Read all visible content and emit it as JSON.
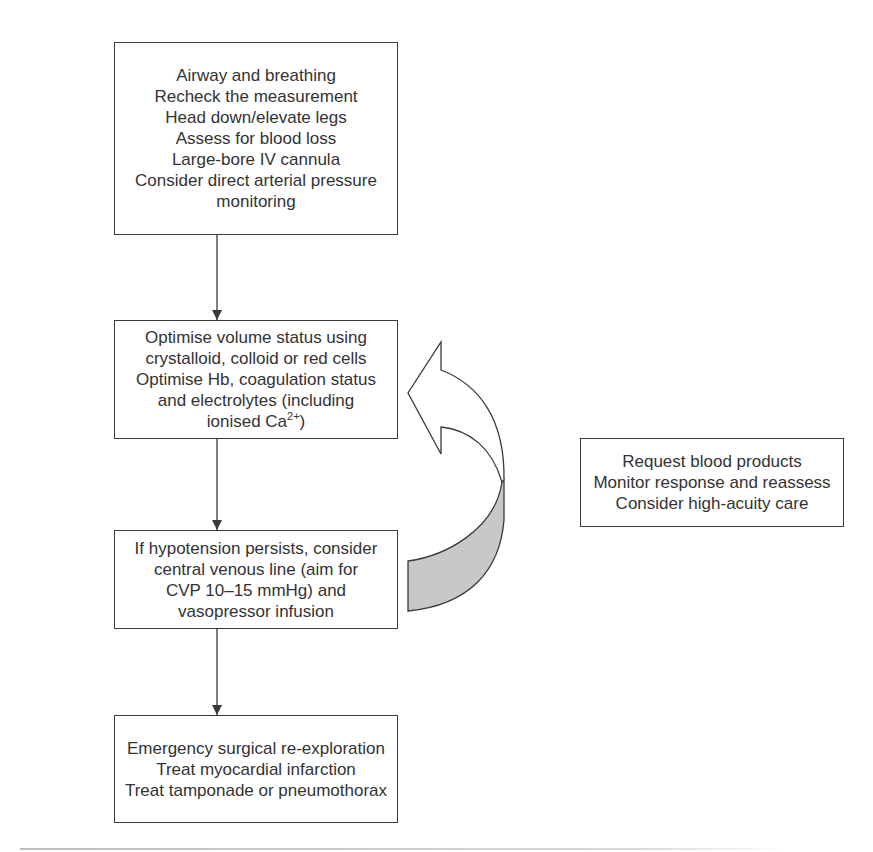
{
  "diagram": {
    "type": "flowchart",
    "boxes": [
      {
        "id": "initial-measures",
        "lines": [
          "Airway and breathing",
          "Recheck the measurement",
          "Head down/elevate legs",
          "Assess for blood loss",
          "Large-bore IV cannula",
          "Consider direct arterial pressure",
          "monitoring"
        ]
      },
      {
        "id": "optimise-volume",
        "lines": [
          "Optimise volume status using",
          "crystalloid, colloid or red cells",
          "Optimise Hb, coagulation status",
          "and electrolytes (including",
          "ionised Ca"
        ],
        "superscript": "2+",
        "suffix": ")"
      },
      {
        "id": "hypotension-persists",
        "lines": [
          "If hypotension persists, consider",
          "central venous line (aim for",
          "CVP 10–15 mmHg) and",
          "vasopressor infusion"
        ]
      },
      {
        "id": "surgical-actions",
        "lines": [
          "Emergency surgical re-exploration",
          "Treat myocardial infarction",
          "Treat tamponade or pneumothorax"
        ]
      },
      {
        "id": "side-actions",
        "lines": [
          "Request blood products",
          "Monitor response and reassess",
          "Consider high-acuity care"
        ]
      }
    ],
    "edges": [
      {
        "from": "initial-measures",
        "to": "optimise-volume"
      },
      {
        "from": "optimise-volume",
        "to": "hypotension-persists"
      },
      {
        "from": "hypotension-persists",
        "to": "surgical-actions"
      },
      {
        "from": "hypotension-persists",
        "to": "optimise-volume",
        "style": "curved-loop-arrow"
      }
    ],
    "colors": {
      "stroke": "#3a3a3a",
      "text": "#333333",
      "loop_fill": "#c8c8c8"
    }
  }
}
